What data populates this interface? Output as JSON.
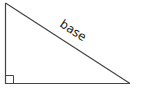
{
  "diagram": {
    "type": "right-triangle",
    "label": "base",
    "label_side": "hypotenuse",
    "right_angle_marker": "bottom-left",
    "colors": {
      "stroke": "#444444",
      "text": "#222222",
      "background": "#ffffff"
    }
  }
}
